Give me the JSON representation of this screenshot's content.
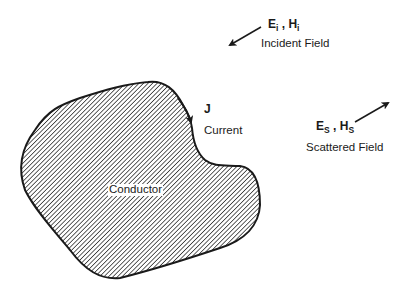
{
  "diagram": {
    "conductor": {
      "label": "Conductor"
    },
    "current": {
      "symbol": "J",
      "label": "Current"
    },
    "incident": {
      "e_symbol": "E",
      "e_subscript": "i",
      "separator": " , ",
      "h_symbol": "H",
      "h_subscript": "i",
      "label": "Incident Field"
    },
    "scattered": {
      "e_symbol": "E",
      "e_subscript": "S",
      "separator": " , ",
      "h_symbol": "H",
      "h_subscript": "S",
      "label": "Scattered Field"
    },
    "colors": {
      "outline": "#1a1a1a",
      "hatch": "#3a3a3a",
      "background": "#ffffff"
    }
  }
}
